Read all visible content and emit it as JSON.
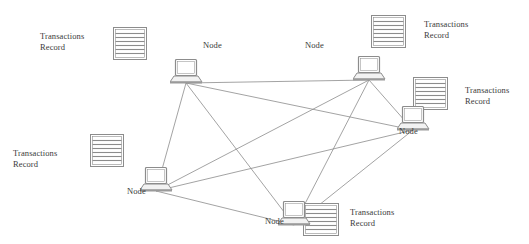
{
  "diagram": {
    "type": "node-network",
    "stroke_color": "#8c8c8c",
    "text_color": "#3a3a3a",
    "background_color": "#ffffff",
    "node_label_text": "Node",
    "record_label_line1": "Transactions",
    "record_label_line2": "Record",
    "nodes": [
      {
        "id": "node-top-left",
        "label": "Node",
        "icon": "laptop-icon",
        "x": 170,
        "y": 58,
        "label_x": 203,
        "label_y": 40,
        "document": {
          "icon": "document-icon",
          "x": 113,
          "y": 27,
          "width": 34,
          "height": 33,
          "rows": 7,
          "label_line1": "Transactions",
          "label_line2": "Record",
          "label_x": 40,
          "label_y": 31
        }
      },
      {
        "id": "node-top-right",
        "label": "Node",
        "icon": "laptop-icon",
        "x": 353,
        "y": 55,
        "label_x": 305,
        "label_y": 40,
        "document": {
          "icon": "document-icon",
          "x": 371,
          "y": 15,
          "width": 35,
          "height": 33,
          "rows": 7,
          "label_line1": "Transactions",
          "label_line2": "Record",
          "label_x": 424,
          "label_y": 19
        }
      },
      {
        "id": "node-right",
        "label": "Node",
        "icon": "laptop-icon",
        "x": 397,
        "y": 105,
        "label_x": 399,
        "label_y": 126,
        "document": {
          "icon": "document-icon",
          "x": 413,
          "y": 77,
          "width": 35,
          "height": 33,
          "rows": 7,
          "label_line1": "Transactions",
          "label_line2": "Record",
          "label_x": 465,
          "label_y": 85
        }
      },
      {
        "id": "node-left",
        "label": "Node",
        "icon": "laptop-icon",
        "x": 140,
        "y": 166,
        "label_x": 127,
        "label_y": 186,
        "document": {
          "icon": "document-icon",
          "x": 90,
          "y": 134,
          "width": 34,
          "height": 33,
          "rows": 7,
          "label_line1": "Transactions",
          "label_line2": "Record",
          "label_x": 13,
          "label_y": 148
        }
      },
      {
        "id": "node-bottom",
        "label": "Node",
        "icon": "laptop-icon",
        "x": 278,
        "y": 200,
        "label_x": 265,
        "label_y": 216,
        "document": {
          "icon": "document-icon",
          "x": 303,
          "y": 203,
          "width": 36,
          "height": 33,
          "rows": 7,
          "label_line1": "Transactions",
          "label_line2": "Record",
          "label_x": 350,
          "label_y": 207
        }
      }
    ],
    "edges": [
      {
        "from": "node-top-left",
        "to": "node-top-right"
      },
      {
        "from": "node-top-left",
        "to": "node-right"
      },
      {
        "from": "node-top-left",
        "to": "node-left"
      },
      {
        "from": "node-top-left",
        "to": "node-bottom"
      },
      {
        "from": "node-top-right",
        "to": "node-right"
      },
      {
        "from": "node-top-right",
        "to": "node-left"
      },
      {
        "from": "node-top-right",
        "to": "node-bottom"
      },
      {
        "from": "node-right",
        "to": "node-left"
      },
      {
        "from": "node-right",
        "to": "node-bottom"
      },
      {
        "from": "node-left",
        "to": "node-bottom"
      }
    ]
  }
}
